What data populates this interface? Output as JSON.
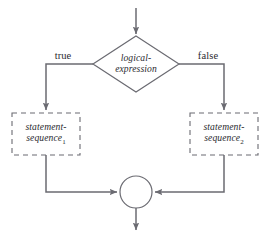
{
  "diagram": {
    "type": "flowchart",
    "colors": {
      "line": "#6b6b72",
      "text": "#2b2b30",
      "background": "#ffffff"
    },
    "entry_arrow": {
      "name": "entry-arrow",
      "from": [
        136,
        8
      ],
      "to": [
        136,
        36
      ]
    },
    "decision": {
      "shape": "diamond",
      "text_line1": "logical-",
      "text_line2": "expression",
      "center": [
        136,
        64
      ],
      "half_width": 43,
      "half_height": 28
    },
    "branches": [
      {
        "label": "true",
        "label_pos": [
          63,
          56
        ],
        "side": "left",
        "turn_x": 46
      },
      {
        "label": "false",
        "label_pos": [
          208,
          56
        ],
        "side": "right",
        "turn_x": 224
      }
    ],
    "process_boxes": [
      {
        "name": "statement-sequence-1",
        "text_line1": "statement-",
        "text_line2": "sequence",
        "subscript": "1",
        "border_style": "dashed",
        "rect": [
          12,
          113,
          68,
          42
        ]
      },
      {
        "name": "statement-sequence-2",
        "text_line1": "statement-",
        "text_line2": "sequence",
        "subscript": "2",
        "border_style": "dashed",
        "rect": [
          190,
          113,
          68,
          42
        ]
      }
    ],
    "merge_node": {
      "shape": "circle",
      "center": [
        136,
        192
      ],
      "radius": 16
    },
    "exit_arrow": {
      "name": "exit-arrow",
      "from": [
        136,
        208
      ],
      "to": [
        136,
        232
      ]
    }
  }
}
